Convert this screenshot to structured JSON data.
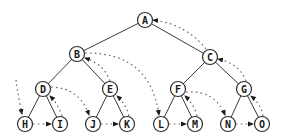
{
  "diagram": {
    "type": "binary-tree-postorder-traversal",
    "colors": {
      "edge": "#3a3a3a",
      "thread": "#6a6a6a",
      "node_fill": "#ffffff",
      "node_stroke": "#2e2e2e",
      "label": "#1a1a1a"
    },
    "node_radius": 7.5,
    "nodes": [
      {
        "id": "A",
        "label": "A",
        "x": 145,
        "y": 20
      },
      {
        "id": "B",
        "label": "B",
        "x": 77,
        "y": 54
      },
      {
        "id": "C",
        "label": "C",
        "x": 210,
        "y": 57
      },
      {
        "id": "D",
        "label": "D",
        "x": 43,
        "y": 89
      },
      {
        "id": "E",
        "label": "E",
        "x": 110,
        "y": 89
      },
      {
        "id": "F",
        "label": "F",
        "x": 178,
        "y": 89
      },
      {
        "id": "G",
        "label": "G",
        "x": 244,
        "y": 89
      },
      {
        "id": "H",
        "label": "H",
        "x": 25,
        "y": 124
      },
      {
        "id": "I",
        "label": "I",
        "x": 60,
        "y": 124
      },
      {
        "id": "J",
        "label": "J",
        "x": 93,
        "y": 124
      },
      {
        "id": "K",
        "label": "K",
        "x": 127,
        "y": 124
      },
      {
        "id": "L",
        "label": "L",
        "x": 161,
        "y": 124
      },
      {
        "id": "M",
        "label": "M",
        "x": 195,
        "y": 124
      },
      {
        "id": "N",
        "label": "N",
        "x": 228,
        "y": 124
      },
      {
        "id": "O",
        "label": "O",
        "x": 262,
        "y": 124
      }
    ],
    "edges": [
      [
        "A",
        "B"
      ],
      [
        "A",
        "C"
      ],
      [
        "B",
        "D"
      ],
      [
        "B",
        "E"
      ],
      [
        "C",
        "F"
      ],
      [
        "C",
        "G"
      ],
      [
        "D",
        "H"
      ],
      [
        "D",
        "I"
      ],
      [
        "E",
        "J"
      ],
      [
        "E",
        "K"
      ],
      [
        "F",
        "L"
      ],
      [
        "F",
        "M"
      ],
      [
        "G",
        "N"
      ],
      [
        "G",
        "O"
      ]
    ],
    "traversal_order": [
      "H",
      "I",
      "D",
      "J",
      "K",
      "E",
      "B",
      "L",
      "M",
      "F",
      "N",
      "O",
      "G",
      "C",
      "A"
    ],
    "threads": [
      {
        "from": "start",
        "to": "H",
        "path": "M16,80 Q18,96 22,114"
      },
      {
        "from": "H",
        "to": "I",
        "path": "M33,124 L51,124"
      },
      {
        "from": "I",
        "to": "D",
        "path": "M62,116 Q58,104 50,96"
      },
      {
        "from": "D",
        "to": "J",
        "path": "M51,87 Q80,88 89,115"
      },
      {
        "from": "J",
        "to": "K",
        "path": "M101,124 L118,124"
      },
      {
        "from": "K",
        "to": "E",
        "path": "M129,116 Q126,104 117,96"
      },
      {
        "from": "E",
        "to": "B",
        "path": "M110,81 Q104,64 85,58"
      },
      {
        "from": "B",
        "to": "L",
        "path": "M85,53 Q150,52 159,115"
      },
      {
        "from": "L",
        "to": "M",
        "path": "M169,124 L186,124"
      },
      {
        "from": "M",
        "to": "F",
        "path": "M197,116 Q194,104 185,96"
      },
      {
        "from": "F",
        "to": "N",
        "path": "M186,92 Q215,90 225,115"
      },
      {
        "from": "N",
        "to": "O",
        "path": "M236,124 L253,124"
      },
      {
        "from": "O",
        "to": "G",
        "path": "M263,116 Q261,104 251,96"
      },
      {
        "from": "G",
        "to": "C",
        "path": "M246,81 Q240,64 218,59"
      },
      {
        "from": "C",
        "to": "A",
        "path": "M206,49 Q186,24 153,20"
      }
    ]
  }
}
